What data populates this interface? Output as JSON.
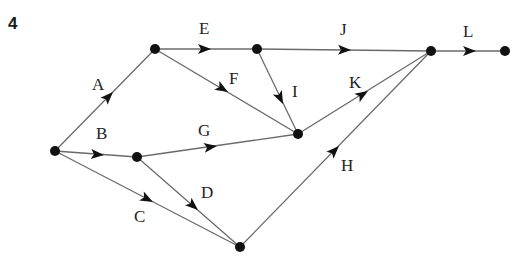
{
  "question_number": "4",
  "diagram": {
    "type": "activity-network",
    "nodes": [
      {
        "id": "n1",
        "x": 55,
        "y": 151
      },
      {
        "id": "n2",
        "x": 155,
        "y": 49
      },
      {
        "id": "n3",
        "x": 137,
        "y": 157
      },
      {
        "id": "n4",
        "x": 257,
        "y": 49
      },
      {
        "id": "n5",
        "x": 298,
        "y": 134
      },
      {
        "id": "n6",
        "x": 240,
        "y": 247
      },
      {
        "id": "n7",
        "x": 431,
        "y": 51
      },
      {
        "id": "n8",
        "x": 505,
        "y": 51
      }
    ],
    "edges": [
      {
        "label": "A",
        "from": "n1",
        "to": "n2"
      },
      {
        "label": "B",
        "from": "n1",
        "to": "n3"
      },
      {
        "label": "C",
        "from": "n1",
        "to": "n6"
      },
      {
        "label": "D",
        "from": "n3",
        "to": "n6"
      },
      {
        "label": "E",
        "from": "n2",
        "to": "n4"
      },
      {
        "label": "F",
        "from": "n2",
        "to": "n5"
      },
      {
        "label": "G",
        "from": "n3",
        "to": "n5"
      },
      {
        "label": "H",
        "from": "n6",
        "to": "n7"
      },
      {
        "label": "I",
        "from": "n4",
        "to": "n5"
      },
      {
        "label": "J",
        "from": "n4",
        "to": "n7"
      },
      {
        "label": "K",
        "from": "n5",
        "to": "n7"
      },
      {
        "label": "L",
        "from": "n7",
        "to": "n8"
      }
    ]
  },
  "labels": {
    "A": "A",
    "B": "B",
    "C": "C",
    "D": "D",
    "E": "E",
    "F": "F",
    "G": "G",
    "H": "H",
    "I": "I",
    "J": "J",
    "K": "K",
    "L": "L"
  }
}
